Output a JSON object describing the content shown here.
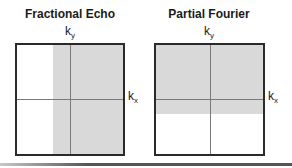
{
  "panels": [
    {
      "title": "Fractional Echo",
      "ky_label": "k",
      "ky_sub": "y",
      "kx_label": "k",
      "kx_sub": "x",
      "shaded_region": "right portion (kx > ~-0.3), full ky range"
    },
    {
      "title": "Partial Fourier",
      "ky_label": "k",
      "ky_sub": "y",
      "kx_label": "k",
      "kx_sub": "x",
      "shaded_region": "top portion (ky > ~-0.2), full kx range"
    }
  ],
  "colors": {
    "shade": "#d9d9d9",
    "border": "#2a2a2a",
    "axis": "#7a7a7a"
  }
}
